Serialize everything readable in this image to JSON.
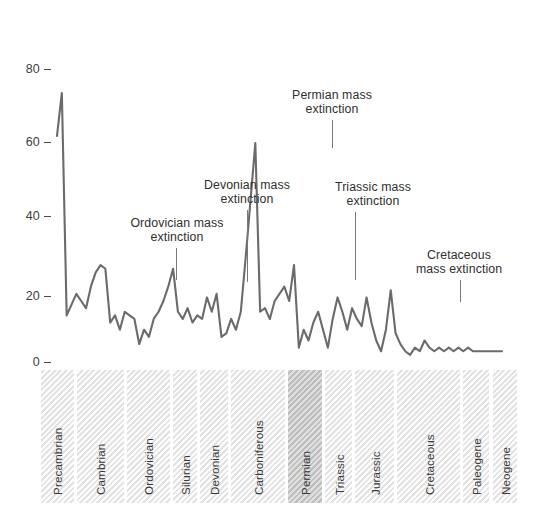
{
  "chart_data": {
    "type": "line",
    "title": "",
    "xlabel": "",
    "ylabel": "",
    "ylim": [
      0,
      88
    ],
    "yticks": [
      0,
      20,
      40,
      60,
      80
    ],
    "ytick_labels": [
      "0",
      "20",
      "40",
      "60",
      "80"
    ],
    "grid": false,
    "legend": "none",
    "line_color": "#6b6b6b",
    "x": [
      0,
      1,
      2,
      3,
      4,
      5,
      6,
      7,
      8,
      9,
      10,
      11,
      12,
      13,
      14,
      15,
      16,
      17,
      18,
      19,
      20,
      21,
      22,
      23,
      24,
      25,
      26,
      27,
      28,
      29,
      30,
      31,
      32,
      33,
      34,
      35,
      36,
      37,
      38,
      39,
      40,
      41,
      42,
      43,
      44,
      45,
      46,
      47,
      48,
      49,
      50,
      51,
      52,
      53,
      54,
      55,
      56,
      57,
      58,
      59,
      60,
      61,
      62,
      63,
      64,
      65,
      66,
      67,
      68,
      69,
      70,
      71,
      72,
      73,
      74,
      75,
      76,
      77,
      78,
      79,
      80,
      81,
      82,
      83,
      84,
      85,
      86,
      87,
      88,
      89,
      90,
      91,
      92
    ],
    "values": [
      63,
      75,
      13,
      16,
      19,
      17,
      15,
      21,
      25,
      27,
      26,
      11,
      13,
      9,
      14,
      13,
      12,
      5,
      9,
      7,
      12,
      14,
      17,
      21,
      26,
      14,
      12,
      15,
      11,
      13,
      12,
      18,
      14,
      19,
      7,
      8,
      12,
      9,
      14,
      29,
      45,
      61,
      14,
      15,
      12,
      17,
      19,
      21,
      17,
      27,
      4,
      9,
      6,
      11,
      14,
      9,
      4,
      12,
      18,
      14,
      9,
      15,
      12,
      10,
      18,
      11,
      6,
      3,
      9,
      20,
      8,
      5,
      3,
      2,
      4,
      3,
      6,
      4,
      3,
      4,
      3,
      4,
      3,
      4,
      3,
      4,
      3,
      3,
      3,
      3,
      3,
      3,
      3
    ],
    "series_name": "Percent of marine genera going extinct",
    "annotations": [
      {
        "label": "Ordovician mass\nextinction",
        "peak_value": 27
      },
      {
        "label": "Devonian mass\nextinction",
        "peak_value": 26
      },
      {
        "label": "Permian mass\nextinction",
        "peak_value": 61
      },
      {
        "label": "Triassic mass\nextinction",
        "peak_value": 27
      },
      {
        "label": "Cretaceous\nmass extinction",
        "peak_value": 20
      }
    ],
    "periods": [
      {
        "name": "Precambrian",
        "highlight": false
      },
      {
        "name": "Cambrian",
        "highlight": false
      },
      {
        "name": "Ordovician",
        "highlight": false
      },
      {
        "name": "Silurian",
        "highlight": false
      },
      {
        "name": "Devonian",
        "highlight": false
      },
      {
        "name": "Carboniferous",
        "highlight": false
      },
      {
        "name": "Permian",
        "highlight": true
      },
      {
        "name": "Triassic",
        "highlight": false
      },
      {
        "name": "Jurassic",
        "highlight": false
      },
      {
        "name": "Cretaceous",
        "highlight": false
      },
      {
        "name": "Paleogene",
        "highlight": false
      },
      {
        "name": "Neogene",
        "highlight": false
      }
    ]
  },
  "axis": {
    "ticks": [
      {
        "label": "80"
      },
      {
        "label": "60"
      },
      {
        "label": "40"
      },
      {
        "label": "20"
      },
      {
        "label": "0"
      }
    ]
  },
  "annotations": [
    {
      "text": "Ordovician mass\nextinction"
    },
    {
      "text": "Devonian mass\nextinction"
    },
    {
      "text": "Permian mass\nextinction"
    },
    {
      "text": "Triassic mass\nextinction"
    },
    {
      "text": "Cretaceous\nmass extinction"
    }
  ],
  "periods": [
    {
      "label": "Precambrian"
    },
    {
      "label": "Cambrian"
    },
    {
      "label": "Ordovician"
    },
    {
      "label": "Silurian"
    },
    {
      "label": "Devonian"
    },
    {
      "label": "Carboniferous"
    },
    {
      "label": "Permian"
    },
    {
      "label": "Triassic"
    },
    {
      "label": "Jurassic"
    },
    {
      "label": "Cretaceous"
    },
    {
      "label": "Paleogene"
    },
    {
      "label": "Neogene"
    }
  ]
}
